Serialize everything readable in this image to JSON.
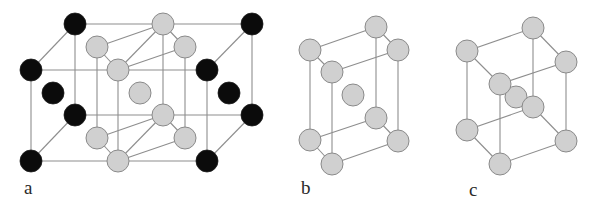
{
  "figure": {
    "colors": {
      "black_atom": "#0b0b0b",
      "gray_atom": "#d0d0d0",
      "gray_atom_outline": "#8a8a8a",
      "bond_line": "#8e8e8e",
      "background": "#ffffff"
    },
    "panels": [
      {
        "id": "a",
        "label": "a",
        "label_pos": [
          24,
          178
        ],
        "atom_radius": 11,
        "atoms": [
          {
            "name": "black-top-back-left",
            "type": "black",
            "x": 75,
            "y": 24
          },
          {
            "name": "black-top-back-right",
            "type": "black",
            "x": 252,
            "y": 24
          },
          {
            "name": "black-top-front-left",
            "type": "black",
            "x": 31,
            "y": 70
          },
          {
            "name": "black-top-front-right",
            "type": "black",
            "x": 207,
            "y": 70
          },
          {
            "name": "black-bottom-back-left",
            "type": "black",
            "x": 75,
            "y": 115
          },
          {
            "name": "black-bottom-back-right",
            "type": "black",
            "x": 252,
            "y": 115
          },
          {
            "name": "black-bottom-front-left",
            "type": "black",
            "x": 31,
            "y": 161
          },
          {
            "name": "black-bottom-front-right",
            "type": "black",
            "x": 207,
            "y": 161
          },
          {
            "name": "black-face-left",
            "type": "black",
            "x": 53,
            "y": 93
          },
          {
            "name": "black-face-right",
            "type": "black",
            "x": 229,
            "y": 93
          },
          {
            "name": "gray-top-back",
            "type": "gray",
            "x": 163,
            "y": 24
          },
          {
            "name": "gray-top-left",
            "type": "gray",
            "x": 97,
            "y": 47
          },
          {
            "name": "gray-top-right",
            "type": "gray",
            "x": 185,
            "y": 47
          },
          {
            "name": "gray-top-front",
            "type": "gray",
            "x": 118,
            "y": 70
          },
          {
            "name": "gray-center",
            "type": "gray",
            "x": 140,
            "y": 93
          },
          {
            "name": "gray-bottom-back",
            "type": "gray",
            "x": 163,
            "y": 115
          },
          {
            "name": "gray-bottom-left",
            "type": "gray",
            "x": 97,
            "y": 138
          },
          {
            "name": "gray-bottom-right",
            "type": "gray",
            "x": 185,
            "y": 138
          },
          {
            "name": "gray-bottom-front",
            "type": "gray",
            "x": 118,
            "y": 161
          }
        ],
        "bonds": [
          [
            75,
            24,
            252,
            24
          ],
          [
            31,
            70,
            207,
            70
          ],
          [
            75,
            115,
            252,
            115
          ],
          [
            31,
            161,
            207,
            161
          ],
          [
            75,
            24,
            31,
            70
          ],
          [
            252,
            24,
            207,
            70
          ],
          [
            75,
            115,
            31,
            161
          ],
          [
            252,
            115,
            207,
            161
          ],
          [
            75,
            24,
            75,
            115
          ],
          [
            252,
            24,
            252,
            115
          ],
          [
            31,
            70,
            31,
            161
          ],
          [
            207,
            70,
            207,
            161
          ],
          [
            97,
            47,
            163,
            24
          ],
          [
            163,
            24,
            185,
            47
          ],
          [
            97,
            47,
            118,
            70
          ],
          [
            118,
            70,
            185,
            47
          ],
          [
            118,
            70,
            163,
            24
          ],
          [
            97,
            138,
            163,
            115
          ],
          [
            163,
            115,
            185,
            138
          ],
          [
            97,
            138,
            118,
            161
          ],
          [
            118,
            161,
            185,
            138
          ],
          [
            118,
            161,
            163,
            115
          ],
          [
            163,
            24,
            163,
            115
          ],
          [
            97,
            47,
            97,
            138
          ],
          [
            185,
            47,
            185,
            138
          ],
          [
            118,
            70,
            118,
            161
          ]
        ]
      },
      {
        "id": "b",
        "label": "b",
        "label_pos": [
          301,
          178
        ],
        "atom_radius": 11,
        "atoms": [
          {
            "name": "gray-top-back",
            "type": "gray",
            "x": 376,
            "y": 27
          },
          {
            "name": "gray-top-left",
            "type": "gray",
            "x": 310,
            "y": 50
          },
          {
            "name": "gray-top-right",
            "type": "gray",
            "x": 398,
            "y": 50
          },
          {
            "name": "gray-top-front",
            "type": "gray",
            "x": 332,
            "y": 72
          },
          {
            "name": "gray-center",
            "type": "gray",
            "x": 353,
            "y": 95
          },
          {
            "name": "gray-bottom-back",
            "type": "gray",
            "x": 376,
            "y": 118
          },
          {
            "name": "gray-bottom-left",
            "type": "gray",
            "x": 310,
            "y": 140
          },
          {
            "name": "gray-bottom-right",
            "type": "gray",
            "x": 398,
            "y": 141
          },
          {
            "name": "gray-bottom-front",
            "type": "gray",
            "x": 332,
            "y": 164
          }
        ],
        "bonds": [
          [
            310,
            50,
            376,
            27
          ],
          [
            376,
            27,
            398,
            50
          ],
          [
            310,
            50,
            332,
            72
          ],
          [
            332,
            72,
            398,
            50
          ],
          [
            310,
            140,
            376,
            118
          ],
          [
            376,
            118,
            398,
            141
          ],
          [
            310,
            140,
            332,
            164
          ],
          [
            332,
            164,
            398,
            141
          ],
          [
            376,
            27,
            376,
            118
          ],
          [
            310,
            50,
            310,
            140
          ],
          [
            398,
            50,
            398,
            141
          ],
          [
            332,
            72,
            332,
            164
          ]
        ]
      },
      {
        "id": "c",
        "label": "c",
        "label_pos": [
          469,
          180
        ],
        "atom_radius": 11,
        "atoms": [
          {
            "name": "gray-top-back",
            "type": "gray",
            "x": 533,
            "y": 28
          },
          {
            "name": "gray-top-left",
            "type": "gray",
            "x": 467,
            "y": 51
          },
          {
            "name": "gray-top-right",
            "type": "gray",
            "x": 566,
            "y": 62
          },
          {
            "name": "gray-inner",
            "type": "gray",
            "x": 516,
            "y": 97
          },
          {
            "name": "gray-top-front",
            "type": "gray",
            "x": 500,
            "y": 84
          },
          {
            "name": "gray-bottom-back",
            "type": "gray",
            "x": 533,
            "y": 107
          },
          {
            "name": "gray-bottom-left",
            "type": "gray",
            "x": 467,
            "y": 130
          },
          {
            "name": "gray-bottom-right",
            "type": "gray",
            "x": 566,
            "y": 141
          },
          {
            "name": "gray-bottom-front",
            "type": "gray",
            "x": 500,
            "y": 164
          }
        ],
        "bonds": [
          [
            467,
            51,
            533,
            28
          ],
          [
            533,
            28,
            566,
            62
          ],
          [
            467,
            51,
            500,
            84
          ],
          [
            500,
            84,
            566,
            62
          ],
          [
            467,
            130,
            533,
            107
          ],
          [
            533,
            107,
            566,
            141
          ],
          [
            467,
            130,
            500,
            164
          ],
          [
            500,
            164,
            566,
            141
          ],
          [
            533,
            28,
            533,
            107
          ],
          [
            467,
            51,
            467,
            130
          ],
          [
            566,
            62,
            566,
            141
          ],
          [
            500,
            84,
            500,
            164
          ]
        ]
      }
    ]
  }
}
